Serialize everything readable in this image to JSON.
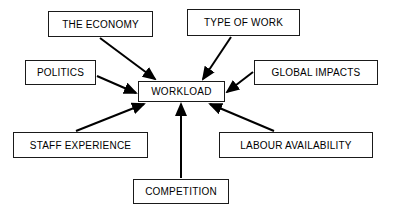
{
  "diagram": {
    "type": "influence-diagram",
    "title": "",
    "central_node": {
      "id": "workload",
      "label": "WORKLOAD",
      "x": 138,
      "y": 81,
      "width": 87,
      "height": 21
    },
    "nodes": [
      {
        "id": "the-economy",
        "label": "THE ECONOMY",
        "x": 48,
        "y": 11,
        "width": 105,
        "height": 26
      },
      {
        "id": "type-of-work",
        "label": "TYPE OF WORK",
        "x": 187,
        "y": 9,
        "width": 113,
        "height": 27
      },
      {
        "id": "politics",
        "label": "POLITICS",
        "x": 25,
        "y": 60,
        "width": 71,
        "height": 25
      },
      {
        "id": "global-impacts",
        "label": "GLOBAL IMPACTS",
        "x": 254,
        "y": 60,
        "width": 124,
        "height": 25
      },
      {
        "id": "staff-experience",
        "label": "STAFF EXPERIENCE",
        "x": 13,
        "y": 132,
        "width": 135,
        "height": 26
      },
      {
        "id": "labour-availability",
        "label": "LABOUR AVAILABILITY",
        "x": 219,
        "y": 132,
        "width": 154,
        "height": 26
      },
      {
        "id": "competition",
        "label": "COMPETITION",
        "x": 133,
        "y": 179,
        "width": 96,
        "height": 25
      }
    ],
    "edges": [
      {
        "id": "edge-the-economy-workload",
        "from": "the-economy",
        "to": "workload",
        "x1": 100,
        "y1": 38,
        "x2": 155,
        "y2": 79
      },
      {
        "id": "edge-type-of-work-workload",
        "from": "type-of-work",
        "to": "workload",
        "x1": 231,
        "y1": 37,
        "x2": 203,
        "y2": 79
      },
      {
        "id": "edge-politics-workload",
        "from": "politics",
        "to": "workload",
        "x1": 97,
        "y1": 76,
        "x2": 136,
        "y2": 93
      },
      {
        "id": "edge-global-impacts-workload",
        "from": "global-impacts",
        "to": "workload",
        "x1": 253,
        "y1": 72,
        "x2": 227,
        "y2": 92
      },
      {
        "id": "edge-staff-experience-workload",
        "from": "staff-experience",
        "to": "workload",
        "x1": 76,
        "y1": 131,
        "x2": 144,
        "y2": 104
      },
      {
        "id": "edge-labour-availability-workload",
        "from": "labour-availability",
        "to": "workload",
        "x1": 274,
        "y1": 131,
        "x2": 210,
        "y2": 104
      },
      {
        "id": "edge-competition-workload",
        "from": "competition",
        "to": "workload",
        "x1": 181,
        "y1": 178,
        "x2": 181,
        "y2": 104
      }
    ],
    "colors": {
      "background": "#ffffff",
      "box_border": "#1a1a1a",
      "box_fill": "#ffffff",
      "text": "#000000",
      "arrow": "#000000"
    }
  }
}
